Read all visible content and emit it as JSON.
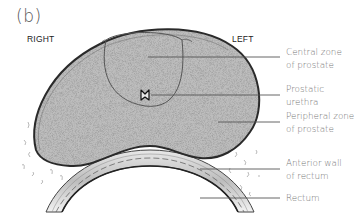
{
  "figure": {
    "panel_label": "(b)",
    "orientation": {
      "right": "RIGHT",
      "left": "LEFT"
    },
    "callouts": [
      {
        "id": "central-zone",
        "text": "Central zone\nof prostate"
      },
      {
        "id": "prostatic-urethra",
        "text": "Prostatic\nurethra"
      },
      {
        "id": "peripheral-zone",
        "text": "Peripheral zone\nof prostate"
      },
      {
        "id": "anterior-wall-rectum",
        "text": "Anterior wall\nof rectum"
      },
      {
        "id": "rectum",
        "text": "Rectum"
      }
    ],
    "colors": {
      "prostate_fill": "#b9b9b9",
      "outline": "#333333",
      "leader_line": "#555555",
      "label_text": "#777777"
    }
  }
}
